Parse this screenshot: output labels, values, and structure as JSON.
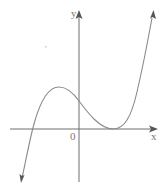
{
  "diagram": {
    "type": "function-graph",
    "axes": {
      "x_label": "x",
      "y_label": "y",
      "origin_label": "0"
    },
    "curve": {
      "kind": "cubic",
      "features": [
        {
          "name": "left-root",
          "description": "crosses x-axis at negative x"
        },
        {
          "name": "local-maximum",
          "description": "above x-axis, left of y-axis"
        },
        {
          "name": "y-intercept",
          "description": "positive"
        },
        {
          "name": "double-root",
          "description": "touches x-axis at positive x (local minimum)"
        }
      ],
      "end_behavior": {
        "left": "down",
        "right": "up"
      }
    },
    "colors": {
      "axis": "#6e6e6e",
      "curve": "#8a8a8a",
      "label": "#777777"
    }
  }
}
